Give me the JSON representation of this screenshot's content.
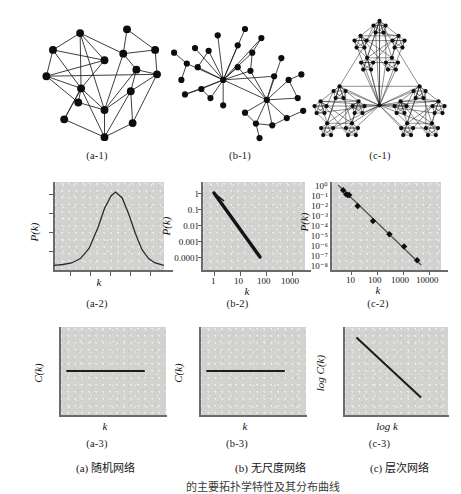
{
  "figure": {
    "title_row_captions": [
      "(a-1)",
      "(b-1)",
      "(c-1)"
    ],
    "mid_row_captions": [
      "(a-2)",
      "(b-2)",
      "(c-2)"
    ],
    "bottom_row_captions": [
      "(a-3)",
      "(b-3)",
      "(c-3)"
    ],
    "bottom_labels": [
      "(a) 随机网络",
      "(b) 无尺度网络",
      "(c) 层次网络"
    ],
    "cropped_footer": "的主要拓扑学特性及其分布曲线",
    "ink_color": "#141414",
    "panel_color": "#d2d2d0",
    "axis_color": "#6b6b6b"
  },
  "networks": [
    {
      "id": "a-1",
      "name": "random-network",
      "node_count": 16,
      "style": "random",
      "nodes": [
        [
          62,
          26
        ],
        [
          112,
          22
        ],
        [
          33,
          44
        ],
        [
          88,
          55
        ],
        [
          108,
          48
        ],
        [
          142,
          44
        ],
        [
          26,
          72
        ],
        [
          122,
          65
        ],
        [
          144,
          70
        ],
        [
          63,
          85
        ],
        [
          116,
          88
        ],
        [
          45,
          118
        ],
        [
          88,
          108
        ],
        [
          118,
          122
        ],
        [
          88,
          137
        ],
        [
          60,
          100
        ]
      ],
      "edges": [
        [
          0,
          2
        ],
        [
          0,
          3
        ],
        [
          0,
          9
        ],
        [
          0,
          12
        ],
        [
          0,
          4
        ],
        [
          2,
          3
        ],
        [
          2,
          6
        ],
        [
          3,
          9
        ],
        [
          4,
          1
        ],
        [
          4,
          5
        ],
        [
          4,
          7
        ],
        [
          4,
          12
        ],
        [
          5,
          8
        ],
        [
          6,
          9
        ],
        [
          6,
          15
        ],
        [
          6,
          8
        ],
        [
          7,
          8
        ],
        [
          7,
          10
        ],
        [
          7,
          12
        ],
        [
          9,
          15
        ],
        [
          9,
          11
        ],
        [
          9,
          12
        ],
        [
          10,
          13
        ],
        [
          10,
          8
        ],
        [
          11,
          14
        ],
        [
          12,
          14
        ],
        [
          13,
          14
        ],
        [
          13,
          8
        ],
        [
          3,
          6
        ],
        [
          9,
          14
        ],
        [
          15,
          12
        ],
        [
          1,
          5
        ],
        [
          2,
          9
        ],
        [
          10,
          12
        ],
        [
          11,
          9
        ],
        [
          14,
          10
        ]
      ]
    },
    {
      "id": "b-1",
      "name": "scale-free-network",
      "node_count": 30,
      "style": "hub-spoke",
      "hubs": [
        [
          64,
          76
        ],
        [
          112,
          98
        ]
      ],
      "nodes": [
        [
          64,
          76
        ],
        [
          112,
          98
        ],
        [
          33,
          41
        ],
        [
          58,
          27
        ],
        [
          88,
          20
        ],
        [
          106,
          30
        ],
        [
          48,
          44
        ],
        [
          80,
          38
        ],
        [
          96,
          46
        ],
        [
          10,
          46
        ],
        [
          24,
          58
        ],
        [
          18,
          76
        ],
        [
          36,
          62
        ],
        [
          40,
          86
        ],
        [
          22,
          92
        ],
        [
          50,
          96
        ],
        [
          64,
          104
        ],
        [
          80,
          62
        ],
        [
          94,
          66
        ],
        [
          128,
          52
        ],
        [
          136,
          76
        ],
        [
          150,
          70
        ],
        [
          120,
          72
        ],
        [
          88,
          112
        ],
        [
          100,
          124
        ],
        [
          118,
          126
        ],
        [
          134,
          118
        ],
        [
          146,
          96
        ],
        [
          152,
          110
        ],
        [
          104,
          140
        ]
      ],
      "edges": [
        [
          0,
          2
        ],
        [
          0,
          3
        ],
        [
          0,
          4
        ],
        [
          0,
          5
        ],
        [
          0,
          6
        ],
        [
          0,
          7
        ],
        [
          0,
          8
        ],
        [
          0,
          10
        ],
        [
          0,
          12
        ],
        [
          0,
          13
        ],
        [
          0,
          14
        ],
        [
          0,
          15
        ],
        [
          0,
          16
        ],
        [
          0,
          17
        ],
        [
          0,
          18
        ],
        [
          0,
          1
        ],
        [
          0,
          22
        ],
        [
          9,
          10
        ],
        [
          10,
          11
        ],
        [
          12,
          6
        ],
        [
          13,
          14
        ],
        [
          15,
          13
        ],
        [
          1,
          17
        ],
        [
          1,
          18
        ],
        [
          1,
          19
        ],
        [
          1,
          20
        ],
        [
          1,
          22
        ],
        [
          1,
          23
        ],
        [
          1,
          24
        ],
        [
          1,
          25
        ],
        [
          1,
          26
        ],
        [
          1,
          27
        ],
        [
          20,
          21
        ],
        [
          26,
          28
        ],
        [
          27,
          20
        ],
        [
          24,
          25
        ],
        [
          25,
          26
        ],
        [
          24,
          29
        ],
        [
          23,
          24
        ],
        [
          5,
          8
        ],
        [
          8,
          18
        ]
      ]
    },
    {
      "id": "c-1",
      "name": "hierarchical-network",
      "style": "fractal-triangle",
      "levels": 2,
      "module_centers": [
        [
          82,
          40
        ],
        [
          38,
          112
        ],
        [
          126,
          112
        ]
      ],
      "node_count": 75
    }
  ],
  "chart_data": [
    {
      "id": "a-2",
      "type": "line",
      "title": "",
      "xlabel": "k",
      "ylabel": "P(k)",
      "scale": "linear",
      "description": "Poisson degree distribution, bell shaped peak",
      "x_tick_labels": [],
      "y_tick_labels": [],
      "curve_points": [
        [
          0.0,
          0.01
        ],
        [
          0.08,
          0.02
        ],
        [
          0.16,
          0.04
        ],
        [
          0.24,
          0.1
        ],
        [
          0.32,
          0.24
        ],
        [
          0.4,
          0.52
        ],
        [
          0.46,
          0.78
        ],
        [
          0.52,
          0.95
        ],
        [
          0.56,
          1.0
        ],
        [
          0.62,
          0.92
        ],
        [
          0.68,
          0.7
        ],
        [
          0.74,
          0.44
        ],
        [
          0.8,
          0.22
        ],
        [
          0.86,
          0.1
        ],
        [
          0.92,
          0.04
        ],
        [
          1.0,
          0.01
        ]
      ]
    },
    {
      "id": "b-2",
      "type": "line",
      "title": "",
      "xlabel": "k",
      "ylabel": "P(k)",
      "scale": "log-log",
      "description": "Power-law degree distribution, straight line on log-log axes",
      "x_tick_labels": [
        "1",
        "10",
        "100",
        "1000"
      ],
      "y_tick_labels": [
        "1",
        "0.1",
        "0.01",
        "0.001",
        "0.0001"
      ],
      "line_endpoints": [
        [
          1,
          1
        ],
        [
          100,
          0.0001
        ]
      ],
      "slope_exponent": -2.0
    },
    {
      "id": "c-2",
      "type": "scatter",
      "title": "",
      "xlabel": "k",
      "ylabel": "P(k)",
      "scale": "log-log",
      "description": "Hierarchical network degree distribution, power law with discrete data points",
      "x_tick_labels": [
        "10",
        "100",
        "1000",
        "10000"
      ],
      "y_tick_labels": [
        "10⁰",
        "10⁻¹",
        "10⁻²",
        "10⁻³",
        "10⁻⁴",
        "10⁻⁵",
        "10⁻⁶",
        "10⁻⁷",
        "10⁻⁸"
      ],
      "points": [
        [
          5,
          0.3
        ],
        [
          6.5,
          0.12
        ],
        [
          7.5,
          0.1
        ],
        [
          8.5,
          0.1
        ],
        [
          18,
          0.008
        ],
        [
          70,
          0.00025
        ],
        [
          300,
          1.2e-05
        ],
        [
          1100,
          7e-07
        ],
        [
          3500,
          3e-08
        ]
      ],
      "fit_line_endpoints": [
        [
          3.2,
          1.0
        ],
        [
          5000,
          1e-08
        ]
      ]
    },
    {
      "id": "a-3",
      "type": "line",
      "title": "",
      "xlabel": "k",
      "ylabel": "C(k)",
      "scale": "linear",
      "description": "Clustering coefficient independent of degree, flat horizontal line",
      "x_tick_labels": [],
      "y_tick_labels": [],
      "line_endpoints": [
        [
          0.06,
          0.5
        ],
        [
          0.8,
          0.5
        ]
      ]
    },
    {
      "id": "b-3",
      "type": "line",
      "title": "",
      "xlabel": "k",
      "ylabel": "C(k)",
      "scale": "linear",
      "description": "Clustering coefficient independent of degree, flat horizontal line",
      "x_tick_labels": [],
      "y_tick_labels": [],
      "line_endpoints": [
        [
          0.06,
          0.5
        ],
        [
          0.8,
          0.5
        ]
      ]
    },
    {
      "id": "c-3",
      "type": "line",
      "title": "",
      "xlabel": "log k",
      "ylabel": "log C(k)",
      "scale": "log-log",
      "description": "Clustering coefficient scales inversely with degree, descending straight line",
      "x_tick_labels": [],
      "y_tick_labels": [],
      "line_endpoints": [
        [
          0.12,
          0.88
        ],
        [
          0.74,
          0.2
        ]
      ]
    }
  ]
}
